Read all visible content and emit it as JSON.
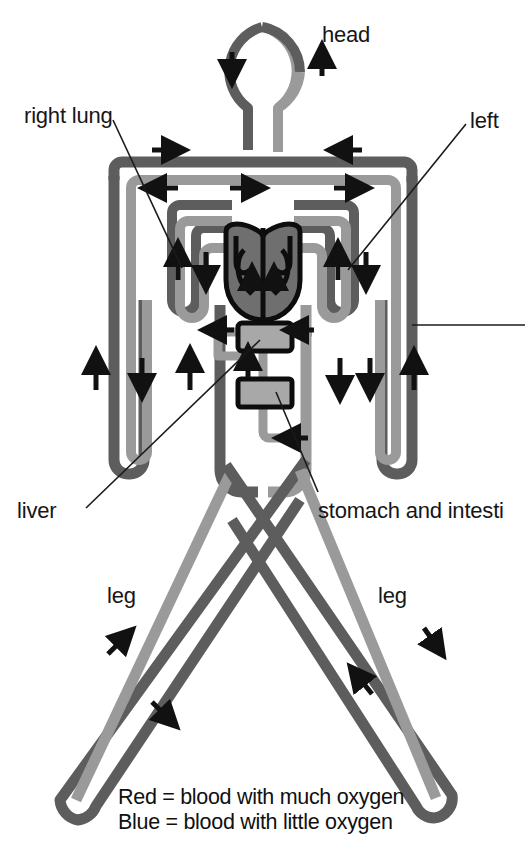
{
  "figure": {
    "background_color": "#ffffff"
  },
  "colors": {
    "oxygen_rich": "#9a9a9a",
    "oxygen_poor": "#5d5d5d",
    "organ_fill": "#a8a8a8",
    "outline": "#111111",
    "arrow": "#111111",
    "leader_line": "#1a1a1a",
    "text": "#161616"
  },
  "labels": [
    {
      "id": "head",
      "text": "head",
      "x": 322,
      "y": 22,
      "truncated": false
    },
    {
      "id": "right-lung",
      "text": "right lung",
      "x": 24,
      "y": 103,
      "truncated": false
    },
    {
      "id": "left-lung",
      "text": "left",
      "x": 470,
      "y": 108,
      "truncated": true
    },
    {
      "id": "liver",
      "text": "liver",
      "x": 17,
      "y": 500,
      "truncated": false
    },
    {
      "id": "stomach-intestines",
      "text": "stomach and intesti",
      "x": 318,
      "y": 500,
      "truncated": true
    },
    {
      "id": "leg-left",
      "text": "leg",
      "x": 107,
      "y": 585,
      "truncated": false
    },
    {
      "id": "leg-right",
      "text": "leg",
      "x": 378,
      "y": 585,
      "truncated": false
    }
  ],
  "legend": {
    "lines": [
      {
        "id": "legend-red",
        "text": "Red = blood with much oxygen",
        "x": 118,
        "y": 787
      },
      {
        "id": "legend-blue",
        "text": "Blue = blood with little oxygen",
        "x": 118,
        "y": 812
      }
    ]
  },
  "organs": [
    {
      "id": "heart",
      "name": "heart",
      "chambers": 4
    },
    {
      "id": "liver-box",
      "name": "liver"
    },
    {
      "id": "stomach-box",
      "name": "stomach and intestines"
    }
  ],
  "regions": [
    {
      "id": "head-loop",
      "name": "head"
    },
    {
      "id": "right-lung",
      "name": "right lung"
    },
    {
      "id": "left-lung",
      "name": "left lung"
    },
    {
      "id": "left-arm",
      "name": "left arm"
    },
    {
      "id": "right-arm",
      "name": "right arm"
    },
    {
      "id": "left-leg",
      "name": "leg"
    },
    {
      "id": "right-leg",
      "name": "leg"
    }
  ],
  "flow_arrows": {
    "count": 26,
    "description": "black directional arrows showing blood flow direction along each vessel"
  }
}
